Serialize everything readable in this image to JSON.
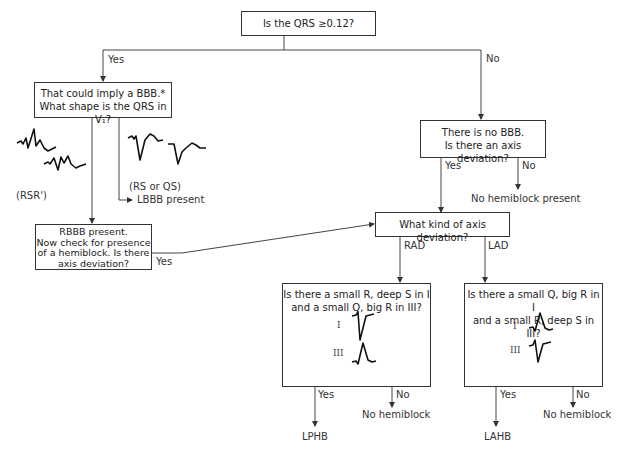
{
  "flowchart": {
    "root": {
      "text": "Is the QRS ≥0.12?"
    },
    "branch_yes_label": "Yes",
    "branch_no_label": "No",
    "bbb_box": {
      "line1": "That could imply a BBB.*",
      "line2": "What shape is the QRS in V₁?"
    },
    "rsr_label": "(RSR')",
    "rs_qs_label": "(RS or QS)",
    "lbbb_label": "LBBB present",
    "rbbb_box": {
      "line1": "RBBB present.",
      "line2": "Now check for presence",
      "line3": "of a hemiblock. Is there",
      "line4": "axis deviation?"
    },
    "rbbb_yes_label": "Yes",
    "no_bbb_box": {
      "line1": "There is no BBB.",
      "line2": "Is there an axis deviation?"
    },
    "no_bbb_yes_label": "Yes",
    "no_bbb_no_label": "No",
    "no_hemiblock_present": "No hemiblock present",
    "axis_box": {
      "text": "What kind of axis deviation?"
    },
    "rad_label": "RAD",
    "lad_label": "LAD",
    "rad_box": {
      "line1": "Is there a small R, deep S in I",
      "line2": "and a small Q, big R in III?",
      "lead1": "I",
      "lead3": "III"
    },
    "lad_box": {
      "line1": "Is there a small Q, big R in I",
      "line2": "and a small R, deep S in III?",
      "lead1": "I",
      "lead3": "III"
    },
    "rad_yes_label": "Yes",
    "rad_no_label": "No",
    "lad_yes_label": "Yes",
    "lad_no_label": "No",
    "rad_no_result": "No hemiblock",
    "lad_no_result": "No hemiblock",
    "rad_yes_result": "LPHB",
    "lad_yes_result": "LAHB"
  },
  "colors": {
    "line": "#333333",
    "background": "#ffffff"
  }
}
